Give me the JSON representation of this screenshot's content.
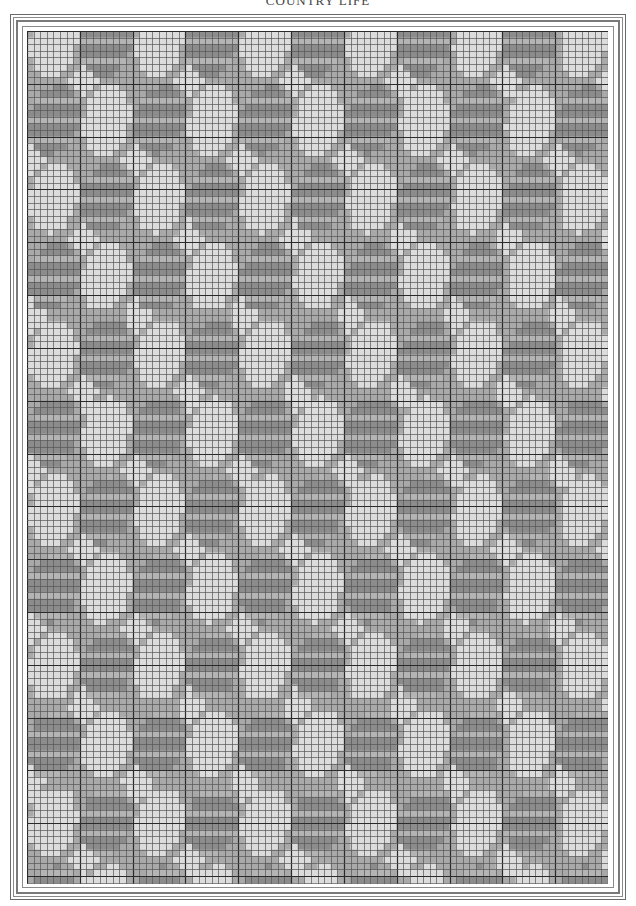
{
  "page": {
    "running_head": "COUNTRY LIFE"
  },
  "draft": {
    "description": "Point-paper weaving draft: diagonal lattice of light ovals and dark striped ovals",
    "grid": {
      "cell_px": 6.6,
      "cols": 88,
      "rows": 129,
      "heavy_line_every": 8
    },
    "colors": {
      "light": "#dcdcdc",
      "mid": "#a9a9a9",
      "dark": "#8c8c8c",
      "stripe": "#b4b4b4",
      "grid_line": "#555555",
      "heavy_line": "#2a2a2a",
      "frame": "#7a7a7a"
    },
    "lattice": {
      "period_x_px": 106,
      "period_y_px": 78,
      "row_offset_x_px": 53,
      "origin_x_px": 79,
      "origin_y_px": 89,
      "light_oval": {
        "rx_px": 24,
        "ry_px": 35
      },
      "dark_oval": {
        "rx_px": 26,
        "ry_px": 34,
        "stripe_every_cells": 2
      },
      "diamond": {
        "r_px": 16
      }
    }
  }
}
